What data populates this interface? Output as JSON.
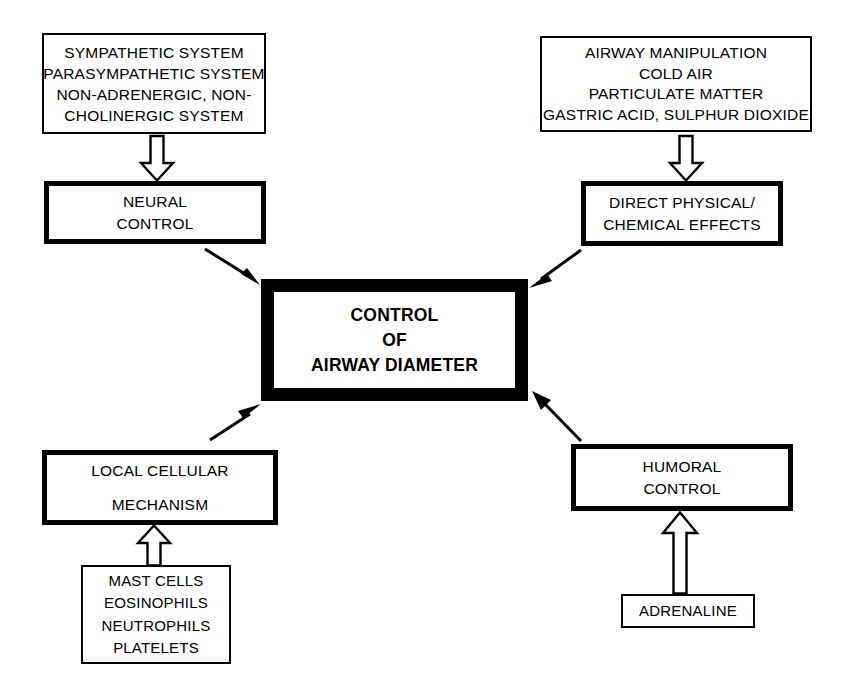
{
  "diagram": {
    "title": "CONTROL OF AIRWAY DIAMETER",
    "stroke_color": "#000000",
    "background_color": "#ffffff",
    "nodes": {
      "stimuli_neural": {
        "lines": [
          "SYMPATHETIC SYSTEM",
          "PARASYMPATHETIC SYSTEM",
          "NON-ADRENERGIC, NON-",
          "CHOLINERGIC SYSTEM"
        ]
      },
      "stimuli_physical": {
        "lines": [
          "AIRWAY MANIPULATION",
          "COLD AIR",
          "PARTICULATE MATTER",
          "GASTRIC ACID, SULPHUR DIOXIDE"
        ]
      },
      "neural_control": {
        "lines": [
          "NEURAL",
          "CONTROL"
        ]
      },
      "direct_effects": {
        "lines": [
          "DIRECT PHYSICAL/",
          "CHEMICAL EFFECTS"
        ]
      },
      "central": {
        "lines": [
          "CONTROL",
          "OF",
          "AIRWAY DIAMETER"
        ]
      },
      "local_cellular": {
        "lines": [
          "LOCAL CELLULAR",
          "MECHANISM"
        ]
      },
      "humoral_control": {
        "lines": [
          "HUMORAL",
          "CONTROL"
        ]
      },
      "cells": {
        "lines": [
          "MAST CELLS",
          "EOSINOPHILS",
          "NEUTROPHILS",
          "PLATELETS"
        ]
      },
      "adrenaline": {
        "lines": [
          "ADRENALINE"
        ]
      }
    },
    "connectors": [
      {
        "name": "block-arrow-down-to-neural-control",
        "style": "hollow-block",
        "direction": "down",
        "from": "stimuli_neural",
        "to": "neural_control"
      },
      {
        "name": "block-arrow-down-to-direct-effects",
        "style": "hollow-block",
        "direction": "down",
        "from": "stimuli_physical",
        "to": "direct_effects"
      },
      {
        "name": "line-arrow-neural-control-to-central",
        "style": "thin-line",
        "direction": "down-right",
        "from": "neural_control",
        "to": "central"
      },
      {
        "name": "line-arrow-direct-effects-to-central",
        "style": "thin-line",
        "direction": "down-left",
        "from": "direct_effects",
        "to": "central"
      },
      {
        "name": "line-arrow-local-cellular-to-central",
        "style": "thin-line",
        "direction": "up-right",
        "from": "local_cellular",
        "to": "central"
      },
      {
        "name": "line-arrow-humoral-control-to-central",
        "style": "thin-line",
        "direction": "up-left",
        "from": "humoral_control",
        "to": "central"
      },
      {
        "name": "block-arrow-up-to-local-cellular",
        "style": "hollow-block",
        "direction": "up",
        "from": "cells",
        "to": "local_cellular"
      },
      {
        "name": "block-arrow-up-to-humoral-control",
        "style": "hollow-block",
        "direction": "up",
        "from": "adrenaline",
        "to": "humoral_control"
      }
    ]
  }
}
